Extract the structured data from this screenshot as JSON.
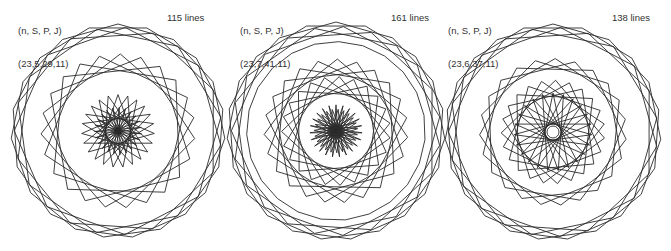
{
  "colors": {
    "stroke": "#2a2a2a",
    "text": "#333333",
    "background": "#ffffff"
  },
  "panels": [
    {
      "param_header": "(n, S, P, J)",
      "param_values": "(23,5,29,11)",
      "line_count": "115 lines",
      "n": 23,
      "S": 5,
      "P": 29,
      "J": 11,
      "center": [
        118,
        131
      ],
      "radius": 107,
      "rings": [
        {
          "r": 1.0,
          "step": 2,
          "rot": 0
        },
        {
          "r": 0.97,
          "step": 3,
          "rot": 0.07
        },
        {
          "r": 0.72,
          "step": 5,
          "rot": 0.03
        },
        {
          "r": 0.34,
          "step": 9,
          "rot": 0.0
        },
        {
          "r": 0.22,
          "step": 11,
          "rot": 0.05
        }
      ]
    },
    {
      "param_header": "(n, S, P, J)",
      "param_values": "(23,7,41,11)",
      "line_count": "161 lines",
      "n": 23,
      "S": 7,
      "P": 41,
      "J": 11,
      "center": [
        336,
        131
      ],
      "radius": 109,
      "rings": [
        {
          "r": 1.0,
          "step": 2,
          "rot": 0
        },
        {
          "r": 0.96,
          "step": 3,
          "rot": 0.07
        },
        {
          "r": 0.82,
          "step": 1,
          "rot": 0.03
        },
        {
          "r": 0.66,
          "step": 5,
          "rot": 0.02
        },
        {
          "r": 0.5,
          "step": 6,
          "rot": 0.06
        },
        {
          "r": 0.24,
          "step": 11,
          "rot": 0.0
        },
        {
          "r": 0.2,
          "step": 10,
          "rot": 0.1
        }
      ]
    },
    {
      "param_header": "(n, S, P, J)",
      "param_values": "(23,6,37,11)",
      "line_count": "138 lines",
      "n": 23,
      "S": 6,
      "P": 37,
      "J": 11,
      "center": [
        553,
        132
      ],
      "radius": 108,
      "rings": [
        {
          "r": 1.0,
          "step": 2,
          "rot": 0
        },
        {
          "r": 0.97,
          "step": 3,
          "rot": 0.07
        },
        {
          "r": 0.68,
          "step": 4,
          "rot": 0.03
        },
        {
          "r": 0.48,
          "step": 6,
          "rot": 0.05
        },
        {
          "r": 0.36,
          "step": 10,
          "rot": 0.0
        }
      ]
    }
  ]
}
